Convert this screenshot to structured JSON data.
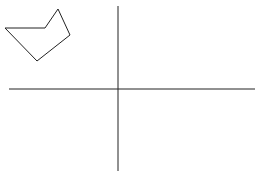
{
  "canvas": {
    "width": 260,
    "height": 174,
    "background": "#ffffff"
  },
  "stroke_color": "#222222",
  "axes": {
    "horizontal": {
      "x1": 9,
      "y1": 89,
      "x2": 255,
      "y2": 89
    },
    "vertical": {
      "x1": 118,
      "y1": 6,
      "x2": 118,
      "y2": 171
    }
  },
  "polygon": {
    "points": [
      [
        5,
        28
      ],
      [
        45,
        28
      ],
      [
        58,
        9
      ],
      [
        70,
        35
      ],
      [
        37,
        61
      ]
    ],
    "fill": "none"
  }
}
